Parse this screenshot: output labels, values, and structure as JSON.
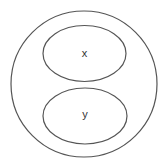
{
  "diagram": {
    "type": "venn-nested-sets",
    "outer_set": {
      "label": "",
      "shape": "circle"
    },
    "inner_sets": [
      {
        "label": "x",
        "shape": "ellipse",
        "position": "top"
      },
      {
        "label": "y",
        "shape": "ellipse",
        "position": "bottom"
      }
    ],
    "stroke_color": "#555555",
    "background": "#ffffff"
  }
}
